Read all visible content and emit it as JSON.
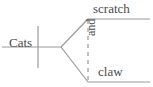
{
  "diagram": {
    "type": "sentence-diagram",
    "style": "reed-kellogg",
    "sentence": "Cats scratch and claw",
    "subject": "Cats",
    "predicates": [
      "scratch",
      "claw"
    ],
    "conjunction": "and",
    "colors": {
      "line": "#9a9a9a",
      "dashed_line": "#9a9a9a",
      "text": "#4a4a4a",
      "background": "#ffffff"
    },
    "labels": {
      "subject": "Cats",
      "verb_one": "scratch",
      "verb_two": "claw",
      "conjunction": "and"
    }
  }
}
